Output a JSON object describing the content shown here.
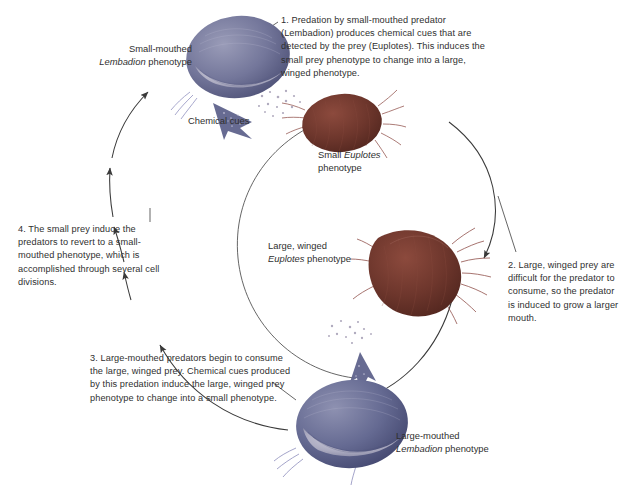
{
  "diagram": {
    "background": "#ffffff",
    "steps": [
      {
        "id": "step-1",
        "number": "1.",
        "text": "1. Predation by small-mouthed predator (Lembadion) produces chemical cues that are detected by the prey (Euplotes). This induces the small prey phenotype to change into a large, winged phenotype."
      },
      {
        "id": "step-2",
        "number": "2.",
        "text": "2. Large, winged prey are difficult for the predator to consume, so the predator is induced to grow a larger mouth."
      },
      {
        "id": "step-3",
        "number": "3.",
        "text": "3. Large-mouthed predators begin to consume the large, winged prey. Chemical cues produced by this predation induce the large, winged prey phenotype to change into a small phenotype."
      },
      {
        "id": "step-4",
        "number": "4.",
        "text": "4. The small prey induce the predators to revert to a small-mouthed phenotype, which is accomplished through several cell divisions."
      }
    ],
    "labels": {
      "small_lembadion_line1": "Small-mouthed",
      "small_lembadion_genus": "Lembadion",
      "small_lembadion_line2": " phenotype",
      "small_euplotes_line1": "Small ",
      "small_euplotes_genus": "Euplotes",
      "small_euplotes_line2": "phenotype",
      "large_euplotes_line1": "Large, winged",
      "large_euplotes_genus": "Euplotes",
      "large_euplotes_line2": " phenotype",
      "large_lembadion_line1": "Large-mouthed",
      "large_lembadion_genus": "Lembadion",
      "large_lembadion_line2": " phenotype",
      "chemical_cues": "Chemical cues"
    },
    "organisms": [
      {
        "id": "small-mouthed-lembadion",
        "kind": "predator",
        "genus": "Lembadion",
        "phenotype": "small-mouthed",
        "color": "#6b6f93",
        "position": "top-left"
      },
      {
        "id": "small-euplotes",
        "kind": "prey",
        "genus": "Euplotes",
        "phenotype": "small",
        "color": "#6e332c",
        "position": "top-right"
      },
      {
        "id": "large-winged-euplotes",
        "kind": "prey",
        "genus": "Euplotes",
        "phenotype": "large, winged",
        "color": "#6e332c",
        "position": "right"
      },
      {
        "id": "large-mouthed-lembadion",
        "kind": "predator",
        "genus": "Lembadion",
        "phenotype": "large-mouthed",
        "color": "#5d6189",
        "position": "bottom"
      }
    ],
    "colors": {
      "predator": "#6b6f93",
      "prey": "#6e332c",
      "arrow": "#3a3a3a",
      "text": "#2f2f2f",
      "cue_dots": "#b9b4c6"
    }
  }
}
